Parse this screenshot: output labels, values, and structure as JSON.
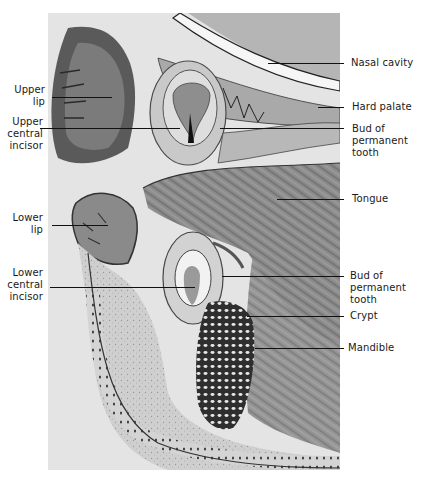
{
  "figure": {
    "colors": {
      "background": "#ffffff",
      "tissue_dark": "#3a3a3a",
      "tissue_mid": "#8a8a8a",
      "tissue_light": "#d8d8d8",
      "label_text": "#1a1a1a"
    }
  },
  "labels_left": [
    {
      "id": "upper-lip",
      "text": "Upper\nlip"
    },
    {
      "id": "upper-central-incisor",
      "text": "Upper\ncentral\nincisor"
    },
    {
      "id": "lower-lip",
      "text": "Lower\nlip"
    },
    {
      "id": "lower-central-incisor",
      "text": "Lower\ncentral\nincisor"
    }
  ],
  "labels_right": [
    {
      "id": "nasal-cavity",
      "text": "Nasal cavity"
    },
    {
      "id": "hard-palate",
      "text": "Hard palate"
    },
    {
      "id": "bud-of-permanent-tooth-upper",
      "text": "Bud of\npermanent\ntooth"
    },
    {
      "id": "tongue",
      "text": "Tongue"
    },
    {
      "id": "bud-of-permanent-tooth-lower",
      "text": "Bud of\npermanent\ntooth"
    },
    {
      "id": "crypt",
      "text": "Crypt"
    },
    {
      "id": "mandible",
      "text": "Mandible"
    }
  ]
}
